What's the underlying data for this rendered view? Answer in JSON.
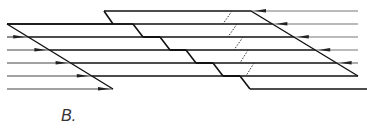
{
  "figure": {
    "label": "B.",
    "colors": {
      "band": "#111111",
      "ray": "#444444",
      "ray_light": "#777777",
      "dotted": "#333333"
    },
    "left_rays_y": [
      24,
      37,
      50,
      63,
      76,
      89
    ],
    "right_rays_y": [
      11,
      24,
      37,
      50,
      63,
      76
    ],
    "left_diagonal": {
      "from": [
        7,
        24
      ],
      "to": [
        113,
        89
      ]
    },
    "right_diagonal": {
      "from": [
        251,
        11
      ],
      "to": [
        358,
        76
      ]
    },
    "ray_left_x": 7,
    "ray_right_x": 358,
    "arrow_direction_left": "right",
    "arrow_direction_right": "left",
    "z_steps": [
      {
        "upper_y": 11,
        "lower_y": 24,
        "x_top": 104,
        "x_bottom": 113
      },
      {
        "upper_y": 24,
        "lower_y": 37,
        "x_top": 133,
        "x_bottom": 143
      },
      {
        "upper_y": 37,
        "lower_y": 50,
        "x_top": 160,
        "x_bottom": 170
      },
      {
        "upper_y": 50,
        "lower_y": 63,
        "x_top": 186,
        "x_bottom": 196
      },
      {
        "upper_y": 63,
        "lower_y": 76,
        "x_top": 213,
        "x_bottom": 223
      },
      {
        "upper_y": 76,
        "lower_y": 89,
        "x_top": 240,
        "x_bottom": 250
      }
    ],
    "dotted_links": [
      {
        "from": [
          232,
          11
        ],
        "to": [
          223,
          24
        ]
      },
      {
        "from": [
          237,
          24
        ],
        "to": [
          228,
          37
        ]
      },
      {
        "from": [
          243,
          37
        ],
        "to": [
          234,
          50
        ]
      },
      {
        "from": [
          248,
          50
        ],
        "to": [
          240,
          63
        ]
      },
      {
        "from": [
          254,
          63
        ],
        "to": [
          246,
          76
        ]
      }
    ]
  }
}
